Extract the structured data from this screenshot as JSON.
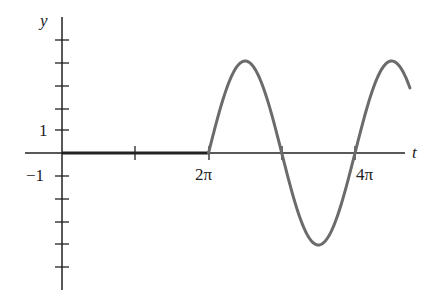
{
  "chart_data": {
    "type": "line",
    "title": "",
    "xlabel": "t",
    "ylabel": "y",
    "function": "y = 0 for t < 2π; y = 4 sin(t) for t ≥ 2π",
    "x_tick_labels": [
      "2π",
      "4π"
    ],
    "x_ticks": [
      "π",
      "2π",
      "3π",
      "4π"
    ],
    "y_tick_labels": [
      "1",
      "−1"
    ],
    "y_ticks": [
      5,
      4,
      3,
      2,
      1,
      -1,
      -2,
      -3,
      -4,
      -5
    ],
    "xlim": [
      "0",
      "≈4.75π"
    ],
    "ylim": [
      -5.5,
      5.5
    ],
    "series": [
      {
        "name": "y(t)",
        "color": "#6b6b6b",
        "x_pi_units": [
          0,
          1,
          2,
          2.5,
          3,
          3.5,
          4,
          4.5,
          4.75
        ],
        "y": [
          0,
          0,
          0,
          4,
          0,
          -4,
          0,
          4,
          2.8
        ]
      }
    ],
    "grid": false,
    "legend": "none"
  },
  "labels": {
    "y_axis": "y",
    "t_axis": "t",
    "tick_one": "1",
    "tick_minus_one": "−1",
    "tick_two_pi": "2π",
    "tick_four_pi": "4π"
  },
  "colors": {
    "axis": "#222222",
    "curve": "#6b6b6b"
  }
}
